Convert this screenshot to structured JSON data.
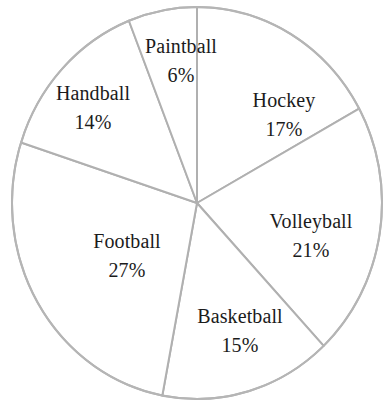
{
  "chart_data": {
    "type": "pie",
    "title": "",
    "subtitle": "",
    "xlabel": "",
    "ylabel": "",
    "units": "percent",
    "total": 100,
    "start_angle_deg": 0,
    "direction": "clockwise",
    "grid": false,
    "legend": "none",
    "label_position": "inside",
    "categories": [
      "Hockey",
      "Volleyball",
      "Basketball",
      "Football",
      "Handball",
      "Paintball"
    ],
    "values": [
      17,
      21,
      15,
      27,
      14,
      6
    ],
    "value_labels": [
      "17%",
      "21%",
      "15%",
      "27%",
      "14%",
      "6%"
    ],
    "slices": [
      {
        "name": "Hockey",
        "value": 17,
        "value_label": "17%",
        "start_deg": 0,
        "end_deg": 61.2,
        "label_x": 284,
        "label_y": 114,
        "fill": "#ffffff",
        "stroke": "#b0b0b0"
      },
      {
        "name": "Volleyball",
        "value": 21,
        "value_label": "21%",
        "start_deg": 61.2,
        "end_deg": 136.8,
        "label_x": 311,
        "label_y": 235,
        "fill": "#ffffff",
        "stroke": "#b0b0b0"
      },
      {
        "name": "Basketball",
        "value": 15,
        "value_label": "15%",
        "start_deg": 136.8,
        "end_deg": 190.8,
        "label_x": 240,
        "label_y": 330,
        "fill": "#ffffff",
        "stroke": "#b0b0b0"
      },
      {
        "name": "Football",
        "value": 27,
        "value_label": "27%",
        "start_deg": 190.8,
        "end_deg": 288.0,
        "label_x": 127,
        "label_y": 255,
        "fill": "#ffffff",
        "stroke": "#b0b0b0"
      },
      {
        "name": "Handball",
        "value": 14,
        "value_label": "14%",
        "start_deg": 288.0,
        "end_deg": 338.4,
        "label_x": 93,
        "label_y": 107,
        "fill": "#ffffff",
        "stroke": "#b0b0b0"
      },
      {
        "name": "Paintball",
        "value": 6,
        "value_label": "6%",
        "start_deg": 338.4,
        "end_deg": 360,
        "label_x": 181,
        "label_y": 60,
        "fill": "#ffffff",
        "stroke": "#b0b0b0"
      }
    ],
    "geometry": {
      "center_x": 197,
      "center_y": 203,
      "radius_x": 185,
      "radius_y": 196
    },
    "style": {
      "background": "#ffffff",
      "outline_color": "#b5b5b5",
      "divider_color": "#b0b0b0",
      "text_color": "#1b1b1b",
      "stroke_width": 2
    }
  }
}
